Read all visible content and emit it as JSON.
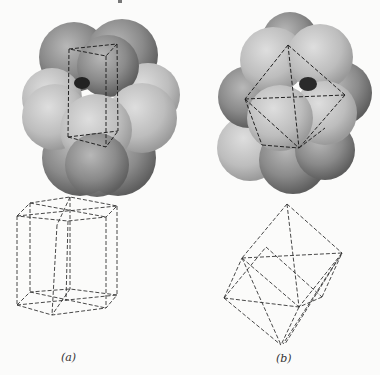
{
  "figure": {
    "panels": [
      {
        "id": "a",
        "label": "(a)",
        "model": "space-filling sphere cluster with hexagonal prism cell outlined",
        "wireframe": "hexagonal prism (dashed)"
      },
      {
        "id": "b",
        "label": "(b)",
        "model": "space-filling sphere cluster with octahedron outlined",
        "wireframe": "octahedral / rhombohedral cell (dashed)"
      }
    ]
  }
}
